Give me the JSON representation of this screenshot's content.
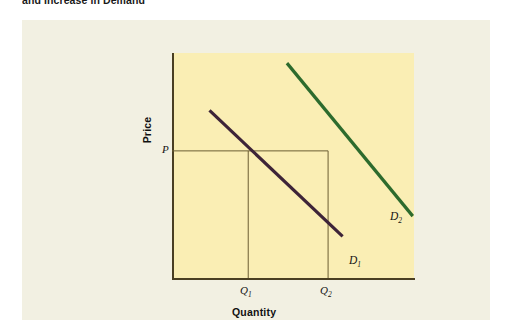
{
  "figure": {
    "caption": "and Increase in Demand"
  },
  "chart_data": {
    "type": "line",
    "title": "and Increase in Demand",
    "xlabel": "Quantity",
    "ylabel": "Price",
    "grid": false,
    "legend_position": "inline-end-of-line",
    "background_plot_color": "#faeeb4",
    "background_panel_color": "#f2f0e2",
    "axis_color": "#4a3f22",
    "guide_line_color": "#6b5d33",
    "annotations": [
      {
        "name": "P",
        "text": "P",
        "sub": "",
        "axis": "y",
        "value": "P"
      },
      {
        "name": "Q1",
        "text": "Q",
        "sub": "1",
        "axis": "x",
        "value": "Q1"
      },
      {
        "name": "Q2",
        "text": "Q",
        "sub": "2",
        "axis": "x",
        "value": "Q2"
      }
    ],
    "series": [
      {
        "name": "D1",
        "label_text": "D",
        "label_sub": "1",
        "color": "#3d2438",
        "description": "original demand curve",
        "x": [
          0.155,
          0.705
        ],
        "y": [
          0.745,
          0.185
        ],
        "intersects_price_at": "Q1"
      },
      {
        "name": "D2",
        "label_text": "D",
        "label_sub": "2",
        "color": "#2d6b2d",
        "description": "increased demand curve shifted right",
        "x": [
          0.475,
          0.995
        ],
        "y": [
          0.955,
          0.275
        ],
        "intersects_price_at": "Q2"
      }
    ],
    "guide_lines": [
      {
        "name": "price-guide",
        "orientation": "horizontal",
        "from": "P",
        "to": "Q2"
      },
      {
        "name": "quantity-1-guide",
        "orientation": "vertical",
        "from": "Q1",
        "to": "P"
      },
      {
        "name": "quantity-2-guide",
        "orientation": "vertical",
        "from": "Q2",
        "to": "P"
      }
    ]
  },
  "labels": {
    "price": "Price",
    "quantity": "Quantity",
    "P": "P",
    "Q": "Q",
    "Q1_sub": "1",
    "Q2_sub": "2",
    "D": "D",
    "D1_sub": "1",
    "D2_sub": "2"
  }
}
